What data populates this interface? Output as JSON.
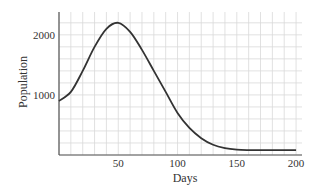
{
  "chart_data": {
    "type": "line",
    "title": "",
    "xlabel": "Days",
    "ylabel": "Population",
    "xlim": [
      0,
      205
    ],
    "ylim": [
      0,
      2380
    ],
    "xticks": [
      50,
      100,
      150,
      200
    ],
    "yticks": [
      1000,
      2000
    ],
    "grid": true,
    "legend": "none",
    "series": [
      {
        "name": "Population",
        "x": [
          0,
          10,
          20,
          30,
          40,
          50,
          60,
          70,
          80,
          90,
          100,
          110,
          120,
          130,
          140,
          150,
          160,
          170,
          180,
          190,
          200
        ],
        "values": [
          900,
          1050,
          1400,
          1800,
          2100,
          2200,
          2050,
          1750,
          1400,
          1050,
          700,
          450,
          280,
          170,
          115,
          90,
          82,
          80,
          80,
          80,
          80
        ]
      }
    ],
    "colors": {
      "line": "#333333",
      "grid": "#d9d9d9",
      "axis": "#555555"
    }
  }
}
